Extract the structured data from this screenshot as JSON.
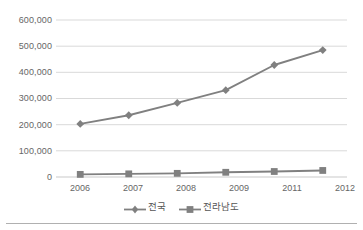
{
  "chart_data": {
    "type": "line",
    "title": "",
    "subtitle": "",
    "xlabel": "",
    "ylabel": "",
    "categories": [
      "2006",
      "2007",
      "2008",
      "2009",
      "2011",
      "2012"
    ],
    "series": [
      {
        "name": "전국",
        "marker": "diamond",
        "color": "#808080",
        "values": [
          203000,
          236000,
          283000,
          332000,
          428000,
          485000
        ]
      },
      {
        "name": "전라남도",
        "marker": "square",
        "color": "#808080",
        "values": [
          10000,
          12000,
          14000,
          18000,
          21000,
          25000
        ]
      }
    ],
    "ylim": [
      0,
      600000
    ],
    "ytick_values": [
      0,
      100000,
      200000,
      300000,
      400000,
      500000,
      600000
    ],
    "ytick_labels": [
      "0",
      "100,000",
      "200,000",
      "300,000",
      "400,000",
      "500,000",
      "600,000"
    ],
    "grid": true,
    "grid_axis": "y",
    "legend_position": "bottom",
    "annotations": []
  },
  "style": {
    "background_color": "#ffffff",
    "gridline_color": "#d9d9d9",
    "axis_text_color": "#666666",
    "series_color": "#808080",
    "border_color": "#b0b0b0"
  }
}
